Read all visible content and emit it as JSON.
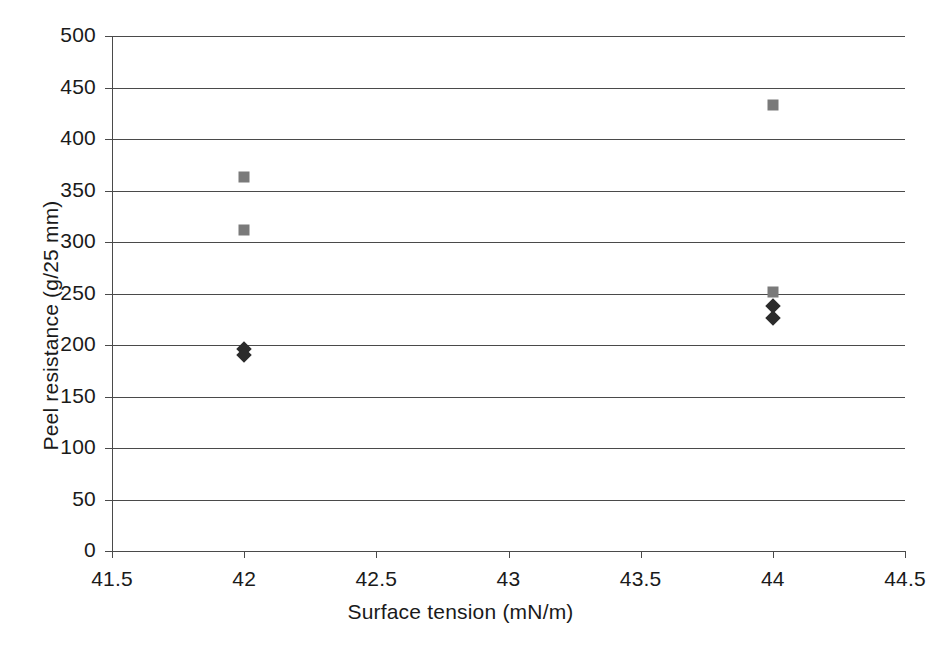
{
  "chart_data": {
    "type": "scatter",
    "title": "",
    "xlabel": "Surface tension (mN/m)",
    "ylabel": "Peel resistance (g/25 mm)",
    "xlim": [
      41.5,
      44.5
    ],
    "ylim": [
      0,
      500
    ],
    "xticks": [
      "41.5",
      "42",
      "42.5",
      "43",
      "43.5",
      "44",
      "44.5"
    ],
    "xtick_values": [
      41.5,
      42,
      42.5,
      43,
      43.5,
      44,
      44.5
    ],
    "yticks": [
      "0",
      "50",
      "100",
      "150",
      "200",
      "250",
      "300",
      "350",
      "400",
      "450",
      "500"
    ],
    "ytick_values": [
      0,
      50,
      100,
      150,
      200,
      250,
      300,
      350,
      400,
      450,
      500
    ],
    "grid": "horizontal",
    "legend": "none",
    "series": [
      {
        "name": "series-diamond",
        "marker": "diamond",
        "color": "#2b2b2b",
        "points": [
          {
            "x": 42,
            "y": 196
          },
          {
            "x": 42,
            "y": 190
          },
          {
            "x": 44,
            "y": 238
          },
          {
            "x": 44,
            "y": 226
          }
        ]
      },
      {
        "name": "series-square",
        "marker": "square",
        "color": "#7a7a7a",
        "points": [
          {
            "x": 42,
            "y": 363
          },
          {
            "x": 42,
            "y": 312
          },
          {
            "x": 44,
            "y": 433
          },
          {
            "x": 44,
            "y": 251
          }
        ]
      }
    ]
  },
  "colors": {
    "background": "#ffffff",
    "axis": "#4a4a4a",
    "text": "#1a1a1a",
    "square_marker": "#7a7a7a",
    "diamond_marker": "#2b2b2b"
  }
}
